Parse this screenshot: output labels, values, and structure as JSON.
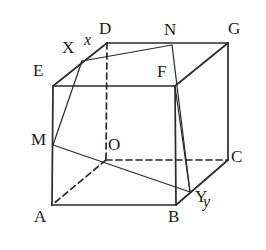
{
  "figure": {
    "kind": "geometry-diagram",
    "stroke_color": "#2a2a2a",
    "background_color": "#fefefe",
    "label_color": "#1b1b1b"
  },
  "vertices": [
    {
      "name": "D",
      "label": "D",
      "x": 107,
      "y": 43,
      "label_x": 99,
      "label_y": 20,
      "hidden": false
    },
    {
      "name": "N",
      "label": "N",
      "x": 172,
      "y": 45,
      "label_x": 164,
      "label_y": 21,
      "hidden": false
    },
    {
      "name": "G",
      "label": "G",
      "x": 228,
      "y": 43,
      "label_x": 228,
      "label_y": 20,
      "hidden": false
    },
    {
      "name": "X",
      "label": "X",
      "x": 82,
      "y": 61,
      "label_x": 62,
      "label_y": 39,
      "hidden": false
    },
    {
      "name": "E",
      "label": "E",
      "x": 53,
      "y": 86,
      "label_x": 33,
      "label_y": 62,
      "hidden": false
    },
    {
      "name": "F",
      "label": "F",
      "x": 175,
      "y": 86,
      "label_x": 157,
      "label_y": 63,
      "hidden": false
    },
    {
      "name": "M",
      "label": "M",
      "x": 53,
      "y": 145,
      "label_x": 31,
      "label_y": 131,
      "hidden": false
    },
    {
      "name": "O",
      "label": "O",
      "x": 106,
      "y": 160,
      "label_x": 108,
      "label_y": 136,
      "hidden": true
    },
    {
      "name": "C",
      "label": "C",
      "x": 228,
      "y": 160,
      "label_x": 231,
      "label_y": 148,
      "hidden": false
    },
    {
      "name": "Y",
      "label": "Y",
      "x": 190,
      "y": 192,
      "label_x": 195,
      "label_y": 188,
      "hidden": false
    },
    {
      "name": "A",
      "label": "A",
      "x": 52,
      "y": 205,
      "label_x": 34,
      "label_y": 208,
      "hidden": false
    },
    {
      "name": "B",
      "label": "B",
      "x": 176,
      "y": 205,
      "label_x": 168,
      "label_y": 208,
      "hidden": false
    }
  ],
  "axis_labels": [
    {
      "name": "x",
      "label": "x",
      "label_x": 84,
      "label_y": 32
    },
    {
      "name": "y",
      "label": "y",
      "label_x": 203,
      "label_y": 194
    }
  ],
  "edges": [
    {
      "name": "edge-E-F",
      "from": "E",
      "to": "F",
      "style": "solid"
    },
    {
      "name": "edge-E-A",
      "from": "E",
      "to": "A",
      "style": "solid"
    },
    {
      "name": "edge-F-B",
      "from": "F",
      "to": "B",
      "style": "solid"
    },
    {
      "name": "edge-A-B",
      "from": "A",
      "to": "B",
      "style": "solid"
    },
    {
      "name": "edge-D-G",
      "from": "D",
      "to": "G",
      "style": "solid"
    },
    {
      "name": "edge-G-C",
      "from": "G",
      "to": "C",
      "style": "solid"
    },
    {
      "name": "edge-F-G",
      "from": "F",
      "to": "G",
      "style": "solid"
    },
    {
      "name": "edge-B-C",
      "from": "B",
      "to": "C",
      "style": "solid"
    },
    {
      "name": "edge-E-D",
      "from": "E",
      "to": "D",
      "style": "solid"
    },
    {
      "name": "edge-D-O",
      "from": "D",
      "to": "O",
      "style": "dashed"
    },
    {
      "name": "edge-O-A",
      "from": "O",
      "to": "A",
      "style": "dashed"
    },
    {
      "name": "edge-O-C",
      "from": "O",
      "to": "C",
      "style": "dashed"
    }
  ],
  "section_lines": [
    {
      "name": "section-X-N",
      "from": "X",
      "to": "N",
      "style": "solid"
    },
    {
      "name": "section-X-M",
      "from": "X",
      "to": "M",
      "style": "solid"
    },
    {
      "name": "section-M-Y",
      "from": "M",
      "to": "Y",
      "style": "solid"
    },
    {
      "name": "section-N-Y",
      "from": "N",
      "to": "Y",
      "style": "solid"
    },
    {
      "name": "section-F-Y",
      "from": "F",
      "to": "Y",
      "style": "solid"
    }
  ]
}
